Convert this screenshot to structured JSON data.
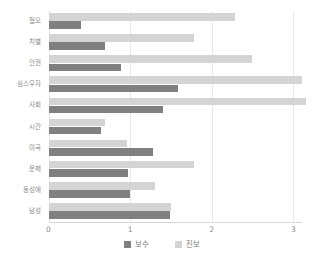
{
  "chart_data": {
    "type": "bar",
    "orientation": "horizontal",
    "title": "",
    "xlabel": "",
    "ylabel": "",
    "xlim": [
      0,
      3.1
    ],
    "xticks": [
      "0",
      "1",
      "2",
      "3"
    ],
    "xtick_values": [
      0,
      1,
      2,
      3
    ],
    "grid": true,
    "legend_position": "bottom",
    "categories": [
      "혐오",
      "치별",
      "인권",
      "심스우자",
      "사회",
      "시간",
      "미국",
      "문제",
      "동성애",
      "남성"
    ],
    "series": [
      {
        "name": "보수",
        "color": "#808080",
        "values": [
          0.4,
          0.69,
          0.89,
          1.59,
          1.4,
          0.64,
          1.28,
          0.97,
          1.0,
          1.49
        ]
      },
      {
        "name": "진보",
        "color": "#d4d4d4",
        "values": [
          2.29,
          1.78,
          2.49,
          3.11,
          3.16,
          0.69,
          0.96,
          1.78,
          1.31,
          1.5
        ]
      }
    ]
  },
  "legend": {
    "items": [
      {
        "label": "보수",
        "swatch": "conservative"
      },
      {
        "label": "진보",
        "swatch": "progressive"
      }
    ]
  }
}
